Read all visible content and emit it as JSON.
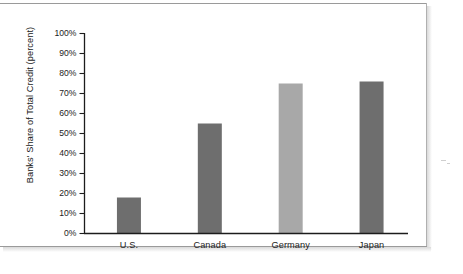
{
  "chart_data": {
    "type": "bar",
    "title": "",
    "subtitle": "",
    "xlabel": "",
    "ylabel": "Banks' Share of Total Credit (percent)",
    "categories": [
      "U.S.",
      "Canada",
      "Germany",
      "Japan"
    ],
    "values": [
      18,
      55,
      75,
      76
    ],
    "value_labels": [
      "18%",
      "55%",
      "75%",
      "76%"
    ],
    "series": [
      {
        "name": "Banks' Share of Total Credit",
        "values": [
          18,
          55,
          75,
          76
        ]
      }
    ],
    "bar_colors": [
      "#6e6e6e",
      "#6e6e6e",
      "#a8a8a8",
      "#6e6e6e"
    ],
    "ylim": [
      0,
      100
    ],
    "ytick_values": [
      0,
      10,
      20,
      30,
      40,
      50,
      60,
      70,
      80,
      90,
      100
    ],
    "ytick_labels": [
      "0%",
      "10%",
      "20%",
      "30%",
      "40%",
      "50%",
      "60%",
      "70%",
      "80%",
      "90%",
      "100%"
    ],
    "grid": false,
    "legend": false,
    "legend_position": "none",
    "axis_color": "#1c1c1c",
    "background_color": "#ffffff",
    "tick_direction": "out"
  },
  "figure": {
    "frame_color": "#9a9a9a",
    "page_background": "#ffffff"
  }
}
